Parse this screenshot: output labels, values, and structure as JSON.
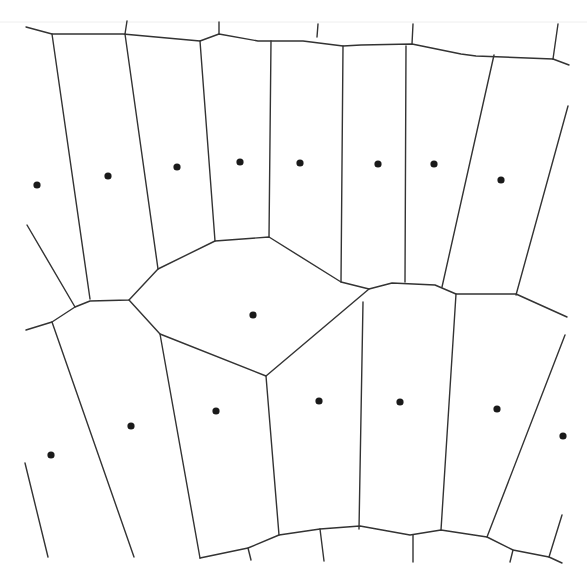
{
  "diagram": {
    "type": "voronoi",
    "title": "",
    "colors": {
      "background": "#ffffff",
      "edge": "#333333",
      "site": "#1a1a1a"
    },
    "sites": [
      {
        "id": "s1",
        "x": 37,
        "y": 185
      },
      {
        "id": "s2",
        "x": 108,
        "y": 176
      },
      {
        "id": "s3",
        "x": 177,
        "y": 167
      },
      {
        "id": "s4",
        "x": 240,
        "y": 162
      },
      {
        "id": "s5",
        "x": 300,
        "y": 163
      },
      {
        "id": "s6",
        "x": 378,
        "y": 164
      },
      {
        "id": "s7",
        "x": 434,
        "y": 164
      },
      {
        "id": "s8",
        "x": 501,
        "y": 180
      },
      {
        "id": "s9",
        "x": 253,
        "y": 315
      },
      {
        "id": "s10",
        "x": 51,
        "y": 455
      },
      {
        "id": "s11",
        "x": 131,
        "y": 426
      },
      {
        "id": "s12",
        "x": 216,
        "y": 411
      },
      {
        "id": "s13",
        "x": 319,
        "y": 401
      },
      {
        "id": "s14",
        "x": 400,
        "y": 402
      },
      {
        "id": "s15",
        "x": 497,
        "y": 409
      },
      {
        "id": "s16",
        "x": 563,
        "y": 436
      }
    ],
    "edges": [
      [
        [
          26,
          27
        ],
        [
          52,
          34
        ],
        [
          123,
          34
        ],
        [
          200,
          41
        ],
        [
          219,
          34
        ],
        [
          258,
          41
        ],
        [
          303,
          41
        ],
        [
          343,
          46
        ],
        [
          361,
          45
        ],
        [
          412,
          44
        ],
        [
          461,
          54
        ],
        [
          476,
          56
        ],
        [
          553,
          59
        ]
      ],
      [
        [
          553,
          59
        ],
        [
          569,
          65
        ]
      ],
      [
        [
          125,
          34
        ],
        [
          127,
          21
        ]
      ],
      [
        [
          219,
          34
        ],
        [
          219,
          22
        ]
      ],
      [
        [
          317,
          37
        ],
        [
          318,
          24
        ]
      ],
      [
        [
          412,
          44
        ],
        [
          413,
          24
        ]
      ],
      [
        [
          553,
          59
        ],
        [
          558,
          24
        ]
      ],
      [
        [
          52,
          34
        ],
        [
          90,
          299
        ]
      ],
      [
        [
          125,
          34
        ],
        [
          158,
          269
        ]
      ],
      [
        [
          200,
          41
        ],
        [
          215,
          241
        ]
      ],
      [
        [
          271,
          41
        ],
        [
          269,
          237
        ]
      ],
      [
        [
          343,
          46
        ],
        [
          341,
          282
        ]
      ],
      [
        [
          406,
          46
        ],
        [
          405,
          282
        ]
      ],
      [
        [
          494,
          55
        ],
        [
          442,
          287
        ]
      ],
      [
        [
          568,
          106
        ],
        [
          516,
          295
        ]
      ],
      [
        [
          27,
          225
        ],
        [
          75,
          307
        ]
      ],
      [
        [
          26,
          330
        ],
        [
          52,
          322
        ],
        [
          75,
          307
        ],
        [
          90,
          301
        ],
        [
          129,
          300
        ],
        [
          158,
          269
        ],
        [
          215,
          241
        ],
        [
          269,
          237
        ],
        [
          341,
          282
        ],
        [
          369,
          289
        ],
        [
          392,
          283
        ],
        [
          435,
          285
        ],
        [
          456,
          294
        ],
        [
          516,
          294
        ],
        [
          567,
          317
        ]
      ],
      [
        [
          129,
          300
        ],
        [
          160,
          334
        ],
        [
          266,
          376
        ],
        [
          369,
          289
        ]
      ],
      [
        [
          52,
          322
        ],
        [
          134,
          557
        ]
      ],
      [
        [
          160,
          334
        ],
        [
          200,
          558
        ]
      ],
      [
        [
          266,
          376
        ],
        [
          279,
          535
        ]
      ],
      [
        [
          363,
          302
        ],
        [
          359,
          529
        ]
      ],
      [
        [
          456,
          294
        ],
        [
          441,
          530
        ]
      ],
      [
        [
          565,
          335
        ],
        [
          487,
          537
        ]
      ],
      [
        [
          25,
          463
        ],
        [
          48,
          557
        ]
      ],
      [
        [
          200,
          558
        ],
        [
          248,
          548
        ],
        [
          279,
          535
        ],
        [
          320,
          529
        ],
        [
          360,
          526
        ],
        [
          410,
          535
        ],
        [
          441,
          530
        ],
        [
          487,
          537
        ],
        [
          513,
          550
        ],
        [
          549,
          557
        ],
        [
          562,
          563
        ]
      ],
      [
        [
          248,
          548
        ],
        [
          251,
          560
        ]
      ],
      [
        [
          320,
          529
        ],
        [
          324,
          561
        ]
      ],
      [
        [
          413,
          535
        ],
        [
          413,
          562
        ]
      ],
      [
        [
          513,
          550
        ],
        [
          510,
          562
        ]
      ],
      [
        [
          549,
          557
        ],
        [
          562,
          515
        ]
      ]
    ]
  }
}
